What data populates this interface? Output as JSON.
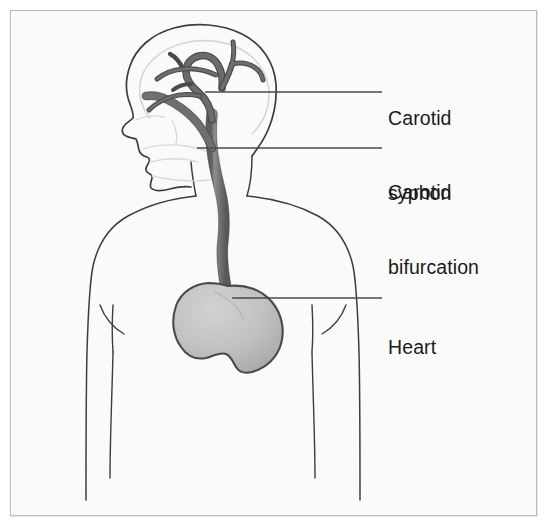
{
  "figure": {
    "kind": "anatomical-diagram",
    "background_color": "#fafafa",
    "frame_border_color": "#b9b9b9",
    "outline_color": "#3a3a3a",
    "faint_outline_color": "#d8d8d8",
    "vessel_color": "#7b7b7b",
    "vessel_edge_color": "#4a4a4a",
    "organ_fill_color": "#bdbdbd",
    "organ_edge_color": "#4a4a4a",
    "leader_line_color": "#4a4a4a",
    "text_color": "#1a1a1a"
  },
  "labels": [
    {
      "id": "carotid-syphon",
      "line1": "Carotid",
      "line2": "syphon",
      "text": "Carotid syphon",
      "leader_from_x": 205,
      "leader_from_y": 92,
      "leader_to_x": 382,
      "leader_to_y": 92
    },
    {
      "id": "carotid-bifurcation",
      "line1": "Carotid",
      "line2": "bifurcation",
      "text": "Carotid bifurcation",
      "leader_from_x": 197,
      "leader_from_y": 148,
      "leader_to_x": 382,
      "leader_to_y": 148
    },
    {
      "id": "heart",
      "line1": "Heart",
      "line2": "",
      "text": "Heart",
      "leader_from_x": 232,
      "leader_from_y": 298,
      "leader_to_x": 382,
      "leader_to_y": 298
    }
  ],
  "anatomy_parts": [
    {
      "id": "skull-cranium",
      "name": "Cranium outline"
    },
    {
      "id": "brain-inner",
      "name": "Inner brain contour"
    },
    {
      "id": "face-profile",
      "name": "Face profile with nose, lips and chin"
    },
    {
      "id": "jaw-faint",
      "name": "Faint mandible and teeth lines"
    },
    {
      "id": "neck",
      "name": "Neck outline"
    },
    {
      "id": "shoulders-torso",
      "name": "Shoulders and torso outline"
    },
    {
      "id": "arm-left",
      "name": "Left arm and armpit line"
    },
    {
      "id": "arm-right",
      "name": "Right arm and armpit line"
    },
    {
      "id": "common-carotid",
      "name": "Common carotid artery ascending the neck"
    },
    {
      "id": "carotid-bifurcation-vessel",
      "name": "Carotid bifurcation into internal and external branches"
    },
    {
      "id": "internal-carotid-syphon",
      "name": "Internal carotid artery forming the carotid syphon"
    },
    {
      "id": "cerebral-branches",
      "name": "Cerebral artery branches"
    },
    {
      "id": "heart-organ",
      "name": "Heart"
    }
  ]
}
